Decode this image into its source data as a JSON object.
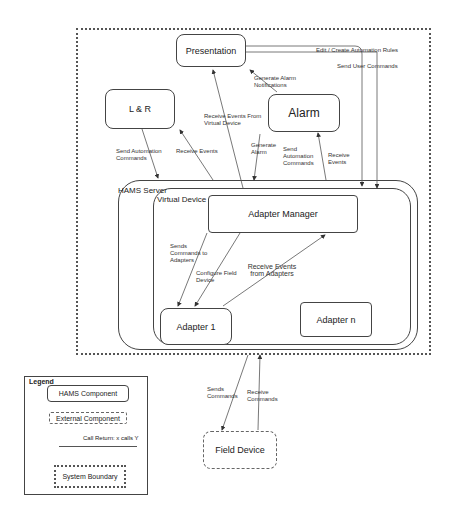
{
  "components": {
    "presentation": "Presentation",
    "lr": "L & R",
    "alarm": "Alarm",
    "hams_server": "HAMS Server",
    "virtual_device": "Virtual Device",
    "adapter_manager": "Adapter Manager",
    "adapter1": "Adapter 1",
    "adaptern": "Adapter n",
    "field_device": "Field Device"
  },
  "arrows": {
    "edit_rules": "Edit / Create Automation Rules",
    "send_user_cmds": "Send User Commands",
    "gen_alarm_notif": "Generate Alarm Notifications",
    "recv_events_vd": "Receive Events From Virtual Device",
    "send_auto_cmds_lr": "Send Automation Commands",
    "recv_events_lr": "Receive Events",
    "gen_alarm": "Generate Alarm",
    "send_auto_cmds_alarm": "Send Automation Commands",
    "recv_events_alarm": "Receive Events",
    "sends_cmds_adapters": "Sends Commands to Adapters",
    "configure_field": "Configure Field Device",
    "recv_events_adapters": "Receive Events from Adapters",
    "sends_cmds": "Sends Commands",
    "receive_cmds": "Receive Commands"
  },
  "legend": {
    "title": "Legend",
    "hams_component": "HAMS Component",
    "external_component": "External Component",
    "call_return": "Call Return: x calls Y",
    "system_boundary": "System Boundary"
  }
}
